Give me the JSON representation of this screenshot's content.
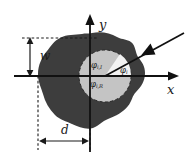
{
  "figure": {
    "name": "scattering-geometry-diagram",
    "axes": {
      "x_label": "x",
      "y_label": "y"
    },
    "dimensions": {
      "width_label": "w",
      "distance_label": "d"
    },
    "angles": [
      {
        "id": "incident",
        "base": "φ",
        "sub": "i,I"
      },
      {
        "id": "ray",
        "base": "φ",
        "sub": "i"
      },
      {
        "id": "reflected",
        "base": "φ",
        "sub": "i,R"
      }
    ],
    "colors": {
      "particle_fill": "#3d3d3d",
      "inner_circle_fill": "#c4c4c4",
      "wedge_fill": "#f2f2f2",
      "stroke": "#1a1a1a",
      "background": "#ffffff"
    }
  }
}
